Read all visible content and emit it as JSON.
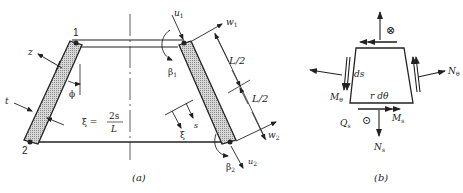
{
  "figure_a": {
    "caption": "(a)",
    "node_labels": {
      "node_1": "1",
      "node_2": "2"
    },
    "symbols": {
      "z": "z",
      "phi": "ϕ",
      "t": "t",
      "u1": "u",
      "u1_sub": "1",
      "w1": "w",
      "w1_sub": "1",
      "beta1": "β",
      "beta1_sub": "1",
      "u2": "u",
      "u2_sub": "2",
      "w2": "w",
      "w2_sub": "2",
      "beta2": "β",
      "beta2_sub": "2",
      "half_length_top": "L/2",
      "half_length_bottom": "L/2",
      "xi": "ξ",
      "s": "s"
    },
    "equation": {
      "lhs": "ξ =",
      "numerator": "2s",
      "denominator": "L"
    }
  },
  "figure_b": {
    "caption": "(b)",
    "symbols": {
      "ds": "ds",
      "r_dtheta": "r dθ",
      "N_theta": "N",
      "N_theta_sub": "θ",
      "M_theta": "M",
      "M_theta_sub": "θ",
      "M_s": "M",
      "M_s_sub": "s",
      "N_s": "N",
      "N_s_sub": "s",
      "Q_s": "Q",
      "Q_s_sub": "s",
      "into_page": "⊗",
      "out_of_page": "⊙"
    }
  }
}
